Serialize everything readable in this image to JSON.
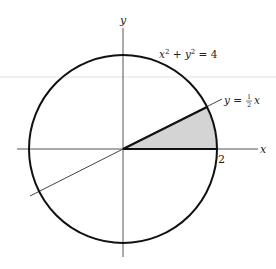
{
  "diagram": {
    "circle_equation": "x² + y² = 4",
    "line_equation": "y = ½ x",
    "line_eq_prefix": "y = ",
    "line_eq_frac_num": "1",
    "line_eq_frac_den": "2",
    "line_eq_suffix": "x",
    "x_axis_label": "x",
    "y_axis_label": "y",
    "x_tick_label": "2",
    "circle_radius": 2,
    "shaded_region": "sector between x-axis and y = ½x inside circle, first quadrant",
    "colors": {
      "stroke": "#111111",
      "axis": "#555555",
      "shade": "#d4d4d4",
      "scan_line": "#e2e2e2"
    }
  }
}
